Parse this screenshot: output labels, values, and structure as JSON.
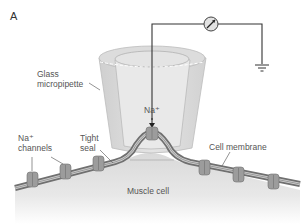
{
  "figure": {
    "panel_label": "A",
    "labels": {
      "glass_micropipette_line1": "Glass",
      "glass_micropipette_line2": "micropipette",
      "na_ion": "Na⁺",
      "na_channels_line1": "Na⁺",
      "na_channels_line2": "channels",
      "tight_seal_line1": "Tight",
      "tight_seal_line2": "seal",
      "cell_membrane": "Cell membrane",
      "muscle_cell": "Muscle cell"
    },
    "icons": [
      "ammeter-icon",
      "ground-icon",
      "ion-channel-icon",
      "arrow-down-icon"
    ],
    "colors": {
      "pipette_glass": "#d6d6d6",
      "pipette_interior": "#e6e6e6",
      "membrane_dark": "#7a7a7a",
      "membrane_light": "#c8c8c8",
      "cell_body": "#e0e0e0",
      "channel": "#9a9a9a",
      "wire": "#333333",
      "label_text": "#555555"
    }
  }
}
